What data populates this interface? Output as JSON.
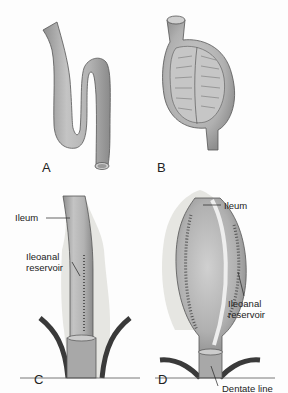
{
  "figure": {
    "panels": [
      {
        "id": "A",
        "letter": "A",
        "description": "Terminal ileum folded into a J/S-shaped loop"
      },
      {
        "id": "B",
        "letter": "B",
        "description": "Ileal limbs opened along the antimesenteric border to form the pouch"
      },
      {
        "id": "C",
        "letter": "C",
        "description": "Pouch brought down to the anal canal"
      },
      {
        "id": "D",
        "letter": "D",
        "description": "Completed ileoanal reservoir anastomosed above the dentate line"
      }
    ],
    "labels": {
      "c_ileum": "Ileum",
      "c_reservoir_line1": "Ileoanal",
      "c_reservoir_line2": "reservoir",
      "d_ileum": "Ileum",
      "d_reservoir_line1": "Ileoanal",
      "d_reservoir_line2": "reservoir",
      "d_dentate": "Dentate line"
    },
    "colors": {
      "background": "#fdfdfd",
      "bowel_fill": "#b4b4b4",
      "bowel_shade": "#9a9a9a",
      "bowel_light": "#cfcfcf",
      "outline": "#555555",
      "muscle": "#3a3a3a",
      "tissue": "#e6e6e2",
      "mucosa_highlight": "#ececec"
    }
  }
}
